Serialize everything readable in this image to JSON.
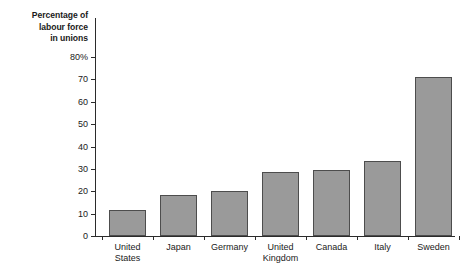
{
  "chart_data": {
    "type": "bar",
    "title": "Percentage of labour force in unions",
    "title_lines": [
      "Percentage of",
      "labour force",
      "in unions"
    ],
    "xlabel": "",
    "ylabel": "",
    "ylim": [
      0,
      80
    ],
    "yticks": [
      0,
      10,
      20,
      30,
      40,
      50,
      60,
      70,
      80
    ],
    "ytick_labels": [
      "0",
      "10",
      "20",
      "30",
      "40",
      "50",
      "60",
      "70",
      "80%"
    ],
    "grid": false,
    "legend": "none",
    "categories": [
      "United States",
      "Japan",
      "Germany",
      "United Kingdom",
      "Canada",
      "Italy",
      "Sweden"
    ],
    "category_lines": [
      [
        "United",
        "States"
      ],
      [
        "Japan"
      ],
      [
        "Germany"
      ],
      [
        "United",
        "Kingdom"
      ],
      [
        "Canada"
      ],
      [
        "Italy"
      ],
      [
        "Sweden"
      ]
    ],
    "values": [
      11.5,
      18.5,
      20,
      28.5,
      29.5,
      33.5,
      71
    ],
    "bar_color": "#9a9a9a",
    "bar_edge_color": "#4d4d4d",
    "axis_color": "#2b2b2b",
    "background_color": "#ffffff"
  }
}
